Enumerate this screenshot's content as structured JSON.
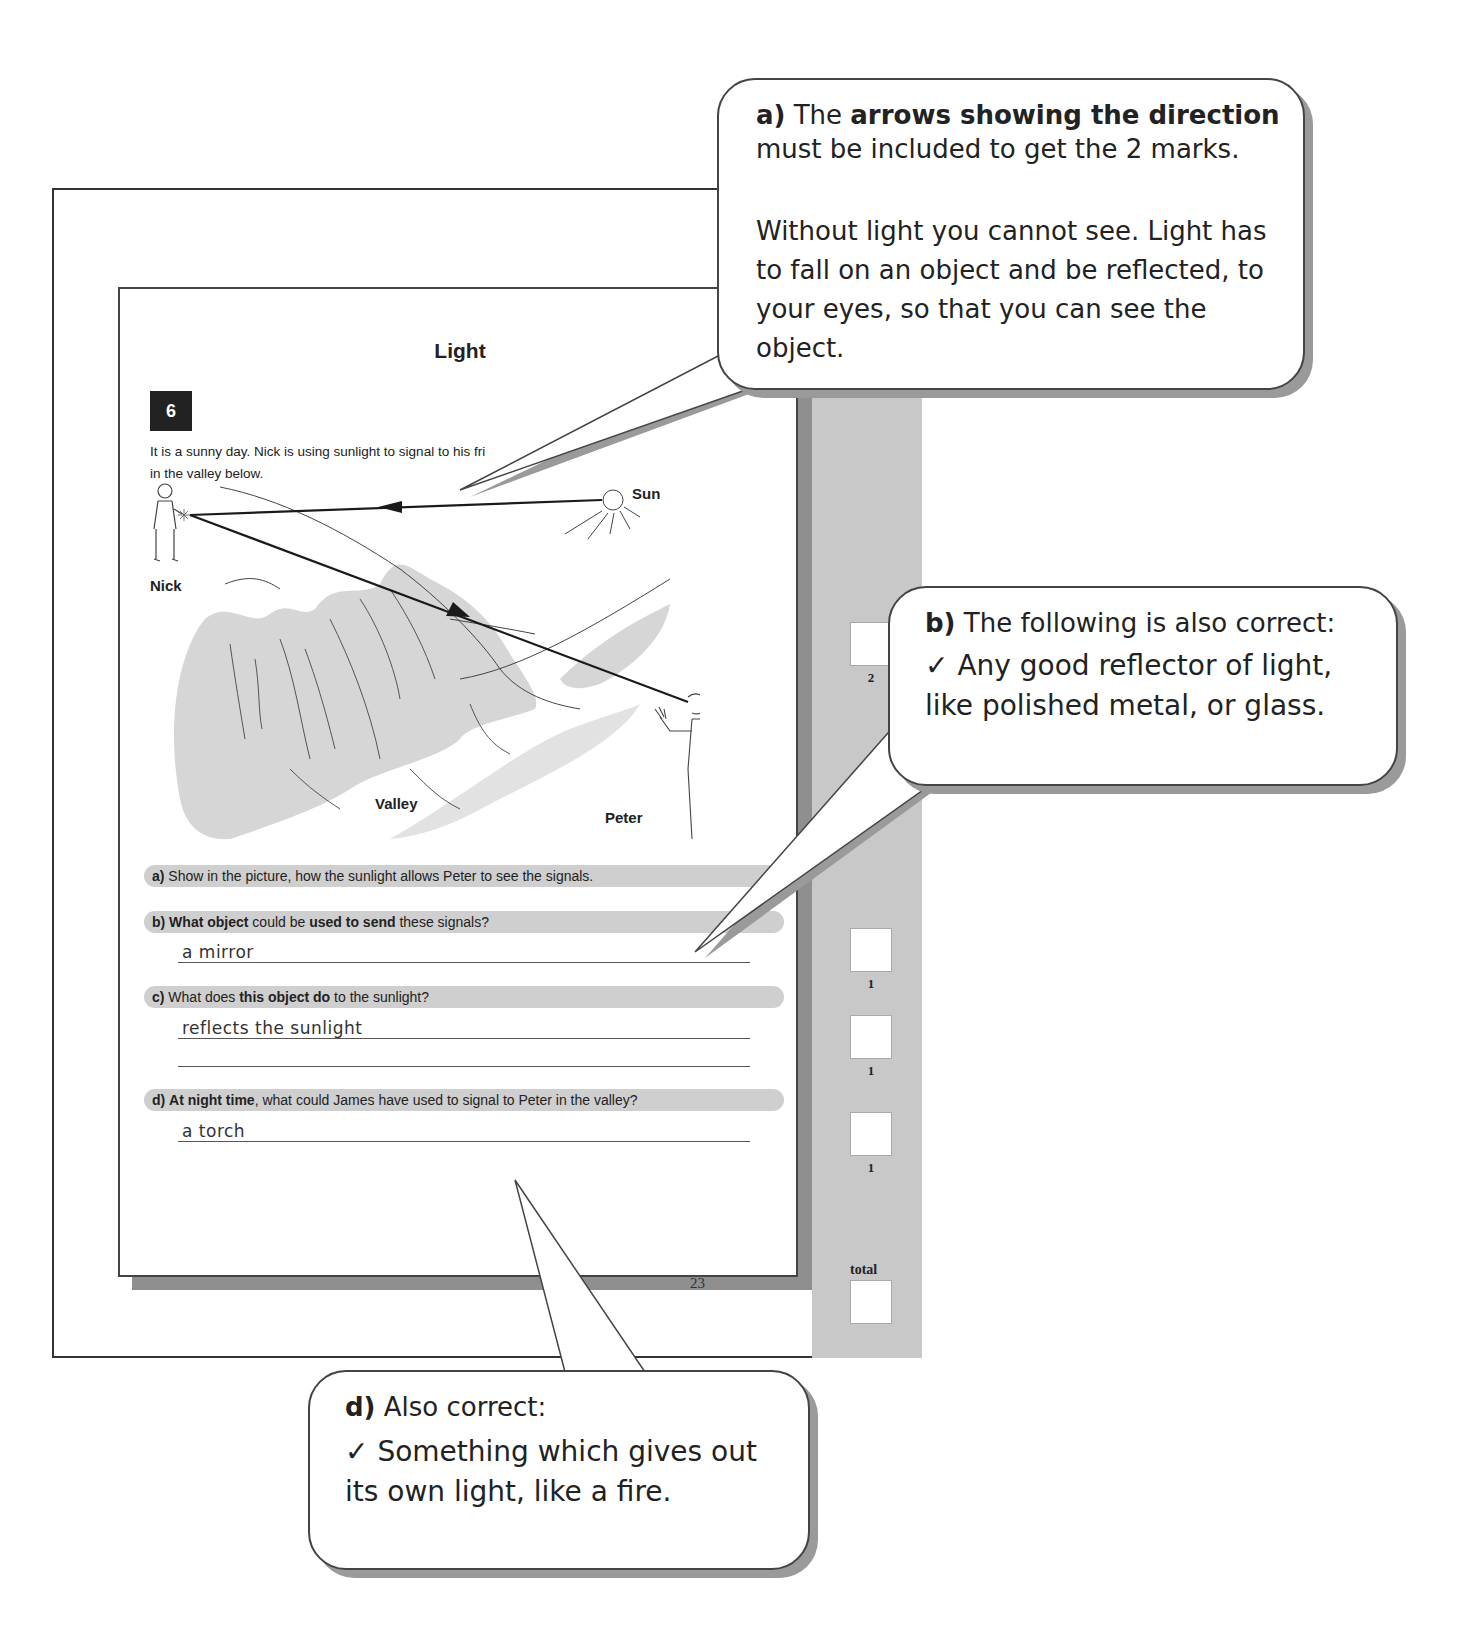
{
  "worksheet": {
    "title": "Light",
    "question_number": "6",
    "intro": "It is a sunny day. Nick is using sunlight to signal to his friend Peter, in the valley below.",
    "intro_visible_line1": "It is a sunny day. Nick is using sunlight to signal to his fri",
    "intro_visible_line1_end": "ter,",
    "intro_line2": "in the valley below.",
    "diagram_labels": {
      "nick": "Nick",
      "sun": "Sun",
      "valley": "Valley",
      "peter": "Peter"
    },
    "questions": [
      {
        "letter": "a)",
        "parts": [
          {
            "t": "Show in the picture, how the sunlight allows Peter to see the signals.",
            "b": false
          }
        ],
        "answers": [],
        "marks": "2"
      },
      {
        "letter": "b)",
        "parts": [
          {
            "t": "What object",
            "b": true
          },
          {
            "t": " could be ",
            "b": false
          },
          {
            "t": "used to send",
            "b": true
          },
          {
            "t": " these signals?",
            "b": false
          }
        ],
        "answers": [
          "a mirror"
        ],
        "marks": "1"
      },
      {
        "letter": "c)",
        "parts": [
          {
            "t": "What does ",
            "b": false
          },
          {
            "t": "this object do",
            "b": true
          },
          {
            "t": " to the sunlight?",
            "b": false
          }
        ],
        "answers": [
          "reflects the sunlight",
          ""
        ],
        "marks": "1"
      },
      {
        "letter": "d)",
        "parts": [
          {
            "t": "At night time",
            "b": true
          },
          {
            "t": ", what could James have used to signal to Peter in the valley?",
            "b": false
          }
        ],
        "answers": [
          "a torch"
        ],
        "marks": "1"
      }
    ],
    "total_label": "total",
    "page_number": "23"
  },
  "callouts": {
    "a": {
      "letter": "a)",
      "p1_pre": "The ",
      "p1_bold": "arrows showing the direction",
      "p1_post": " must be included to get the 2 marks.",
      "p2": "Without light you cannot see. Light has to fall on an object and be reflected, to your eyes, so that you can see the object."
    },
    "b": {
      "letter": "b)",
      "heading": "The following is also correct:",
      "tick": "✓",
      "text": "Any good reflector of light, like polished metal, or glass."
    },
    "d": {
      "letter": "d)",
      "heading": "Also correct:",
      "tick": "✓",
      "text": "Something which gives out its own light, like a fire."
    }
  },
  "colors": {
    "question_bar": "#cfcfcf",
    "strip": "#c8c8c8",
    "shadow": "#9a9a9a",
    "ink": "#222222"
  }
}
